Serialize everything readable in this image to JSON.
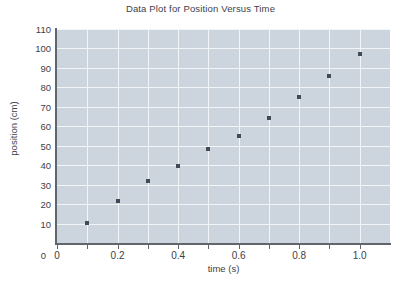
{
  "chart_data": {
    "type": "scatter",
    "title": "Data Plot for Position Versus Time",
    "xlabel": "time (s)",
    "ylabel": "position (cm)",
    "xlim": [
      0,
      1.1
    ],
    "ylim": [
      0,
      110
    ],
    "grid": true,
    "legend": null,
    "x_ticks": [
      {
        "value": 0,
        "label": "0"
      },
      {
        "value": 0.1,
        "label": ""
      },
      {
        "value": 0.2,
        "label": "0.2"
      },
      {
        "value": 0.3,
        "label": ""
      },
      {
        "value": 0.4,
        "label": "0.4"
      },
      {
        "value": 0.5,
        "label": ""
      },
      {
        "value": 0.6,
        "label": "0.6"
      },
      {
        "value": 0.7,
        "label": ""
      },
      {
        "value": 0.8,
        "label": "0.8"
      },
      {
        "value": 0.9,
        "label": ""
      },
      {
        "value": 1.0,
        "label": "1.0"
      }
    ],
    "y_ticks": [
      {
        "value": 0,
        "label": "0"
      },
      {
        "value": 10,
        "label": "10"
      },
      {
        "value": 20,
        "label": "20"
      },
      {
        "value": 30,
        "label": "30"
      },
      {
        "value": 40,
        "label": "40"
      },
      {
        "value": 50,
        "label": "50"
      },
      {
        "value": 60,
        "label": "60"
      },
      {
        "value": 70,
        "label": "70"
      },
      {
        "value": 80,
        "label": "80"
      },
      {
        "value": 90,
        "label": "90"
      },
      {
        "value": 100,
        "label": "100"
      },
      {
        "value": 110,
        "label": "110"
      }
    ],
    "x": [
      0.1,
      0.2,
      0.3,
      0.4,
      0.5,
      0.6,
      0.7,
      0.8,
      0.9,
      1.0
    ],
    "values": [
      10.5,
      21.5,
      32,
      39.5,
      48.5,
      55,
      64,
      75,
      86,
      97
    ],
    "series": [
      {
        "name": "position",
        "marker": "square",
        "color": "#414a57",
        "points": [
          {
            "x": 0.1,
            "y": 10.5
          },
          {
            "x": 0.2,
            "y": 21.5
          },
          {
            "x": 0.3,
            "y": 32
          },
          {
            "x": 0.4,
            "y": 39.5
          },
          {
            "x": 0.5,
            "y": 48.5
          },
          {
            "x": 0.6,
            "y": 55
          },
          {
            "x": 0.7,
            "y": 64
          },
          {
            "x": 0.8,
            "y": 75
          },
          {
            "x": 0.9,
            "y": 86
          },
          {
            "x": 1.0,
            "y": 97
          }
        ]
      }
    ],
    "colors": {
      "plot_background": "#ccd4dd",
      "gridline": "#f2f5f8",
      "axis": "#5f666d",
      "marker": "#414a57",
      "text": "#3c4148",
      "page_background": "#ffffff"
    }
  }
}
